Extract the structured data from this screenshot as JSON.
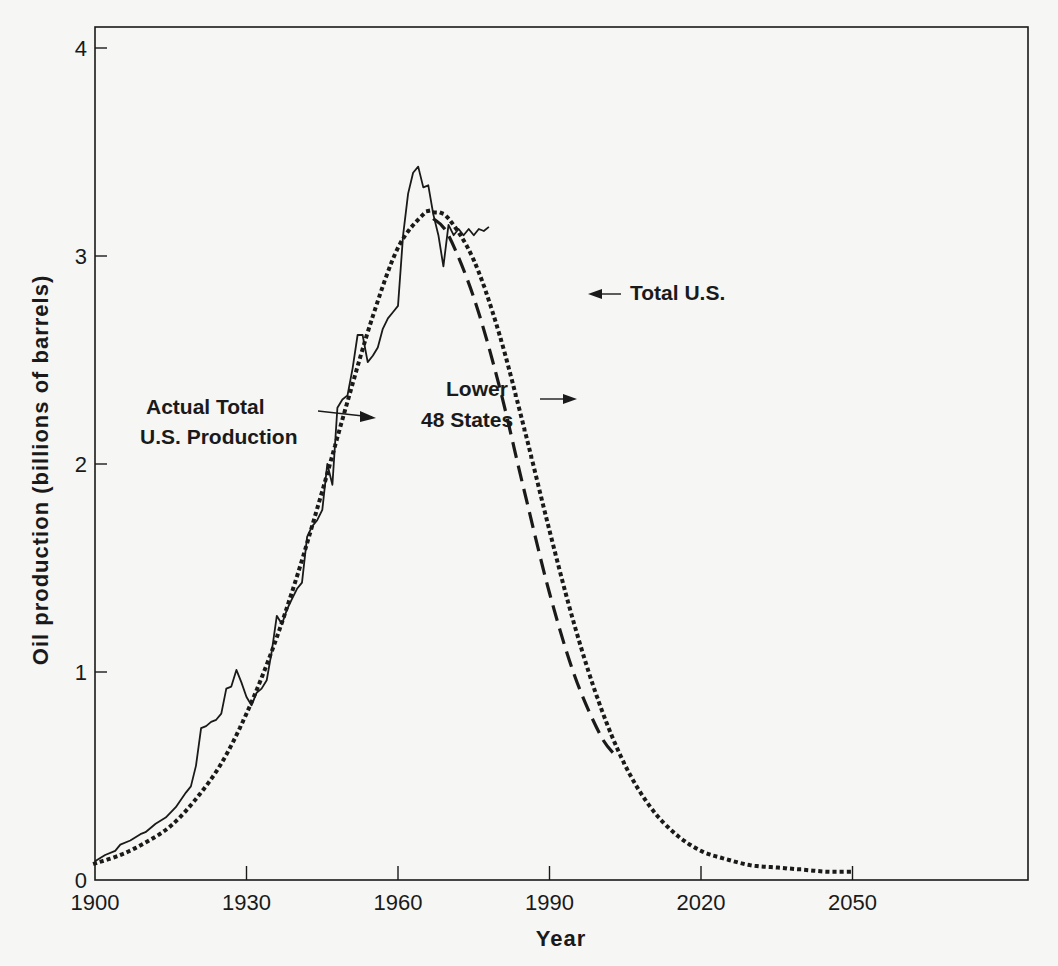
{
  "chart_data": {
    "type": "line",
    "title": "",
    "xlabel": "Year",
    "ylabel": "Oil production (billions of barrels)",
    "xlim": [
      1900,
      2060
    ],
    "ylim": [
      0,
      4.1
    ],
    "x_ticks": [
      1900,
      1930,
      1960,
      1990,
      2020,
      2050
    ],
    "x_tick_labels": [
      "1900",
      "1930",
      "1960",
      "1990",
      "2020",
      "2050"
    ],
    "y_ticks": [
      0,
      1,
      2,
      3,
      4
    ],
    "y_tick_labels": [
      "0",
      "1",
      "2",
      "3",
      "4"
    ],
    "grid": false,
    "legend": "none (inline annotations)",
    "series": [
      {
        "name": "Actual Total U.S. Production",
        "style": "solid",
        "x": [
          1900,
          1902,
          1904,
          1905,
          1907,
          1909,
          1910,
          1912,
          1914,
          1916,
          1918,
          1919,
          1920,
          1921,
          1922,
          1923,
          1924,
          1925,
          1926,
          1927,
          1928,
          1929,
          1930,
          1931,
          1932,
          1933,
          1934,
          1935,
          1936,
          1937,
          1938,
          1939,
          1940,
          1941,
          1942,
          1943,
          1944,
          1945,
          1946,
          1947,
          1948,
          1949,
          1950,
          1951,
          1952,
          1953,
          1954,
          1955,
          1956,
          1957,
          1958,
          1959,
          1960,
          1961,
          1962,
          1963,
          1964,
          1965,
          1966,
          1967,
          1968,
          1969,
          1970,
          1971,
          1972,
          1973,
          1974,
          1975,
          1976,
          1977,
          1978
        ],
        "values": [
          0.09,
          0.12,
          0.14,
          0.17,
          0.19,
          0.22,
          0.23,
          0.27,
          0.3,
          0.35,
          0.42,
          0.45,
          0.55,
          0.73,
          0.74,
          0.76,
          0.77,
          0.8,
          0.92,
          0.93,
          1.01,
          0.95,
          0.88,
          0.84,
          0.9,
          0.92,
          0.96,
          1.1,
          1.27,
          1.23,
          1.3,
          1.35,
          1.4,
          1.43,
          1.65,
          1.7,
          1.73,
          1.78,
          2.0,
          1.9,
          2.27,
          2.31,
          2.33,
          2.46,
          2.62,
          2.62,
          2.49,
          2.52,
          2.56,
          2.65,
          2.7,
          2.73,
          2.76,
          3.1,
          3.3,
          3.4,
          3.43,
          3.33,
          3.34,
          3.2,
          3.1,
          2.95,
          3.15,
          3.1,
          3.13,
          3.1,
          3.13,
          3.1,
          3.13,
          3.12,
          3.14
        ]
      },
      {
        "name": "Total U.S. (Hubbert curve)",
        "style": "dotted",
        "x": [
          1900,
          1905,
          1910,
          1915,
          1920,
          1925,
          1930,
          1935,
          1940,
          1945,
          1950,
          1955,
          1960,
          1965,
          1967,
          1970,
          1975,
          1980,
          1985,
          1990,
          1995,
          2000,
          2005,
          2010,
          2015,
          2020,
          2025,
          2030,
          2035,
          2040,
          2045,
          2050
        ],
        "values": [
          0.08,
          0.12,
          0.18,
          0.26,
          0.39,
          0.56,
          0.8,
          1.1,
          1.46,
          1.87,
          2.3,
          2.71,
          3.04,
          3.2,
          3.21,
          3.18,
          2.98,
          2.63,
          2.17,
          1.68,
          1.22,
          0.84,
          0.55,
          0.35,
          0.22,
          0.14,
          0.1,
          0.07,
          0.06,
          0.05,
          0.04,
          0.04
        ]
      },
      {
        "name": "Lower 48 States",
        "style": "dashed",
        "x": [
          1967,
          1970,
          1975,
          1980,
          1985,
          1990,
          1995,
          2000,
          2003
        ],
        "values": [
          3.18,
          3.1,
          2.8,
          2.38,
          1.87,
          1.38,
          0.98,
          0.7,
          0.6
        ]
      }
    ],
    "annotations": [
      {
        "text": "Actual Total U.S. Production",
        "line1": "Actual Total",
        "line2": "U.S. Production",
        "points_to_year": 1947,
        "points_to_value": 2.24
      },
      {
        "text": "Total U.S.",
        "points_to_year": 1978,
        "points_to_value": 2.82
      },
      {
        "text": "Lower 48 States",
        "line1": "Lower",
        "line2": "48 States",
        "points_to_year": 1982,
        "points_to_value": 2.3
      }
    ]
  },
  "labels": {
    "xlabel": "Year",
    "ylabel": "Oil production (billions of barrels)",
    "annot_actual_line1": "Actual Total",
    "annot_actual_line2": "U.S. Production",
    "annot_total": "Total U.S.",
    "annot_lower_line1": "Lower",
    "annot_lower_line2": "48 States"
  },
  "colors": {
    "ink": "#1a1a1a",
    "paper": "#f6f6f4"
  }
}
